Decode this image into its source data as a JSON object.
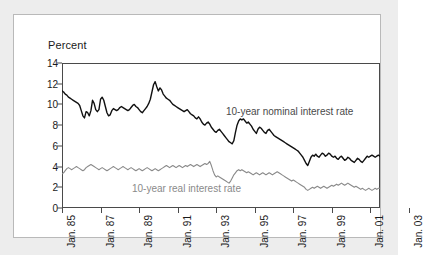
{
  "figure": {
    "y_axis_title": "Percent",
    "annotations": {
      "nominal": "10-year nominal interest rate",
      "real": "10-year real interest rate"
    }
  },
  "chart_data": {
    "type": "line",
    "title": "",
    "xlabel": "",
    "ylabel": "Percent",
    "ylim": [
      0,
      14
    ],
    "yticks": [
      "0",
      "2",
      "4",
      "6",
      "8",
      "10",
      "12",
      "14"
    ],
    "grid": false,
    "legend_position": "inline-annotation",
    "xlim": [
      "Jan. 85",
      "Jul. 03"
    ],
    "xticks": [
      "Jan. 85",
      "Jan. 87",
      "Jan. 89",
      "Jan. 91",
      "Jan. 93",
      "Jan. 95",
      "Jan. 97",
      "Jan. 99",
      "Jan. 01",
      "Jan. 03"
    ],
    "colors": {
      "nominal": "#111111",
      "real": "#8a8a8a"
    },
    "series": [
      {
        "name": "10-year nominal interest rate",
        "color": "#111111",
        "values": [
          11.3,
          11.2,
          11.0,
          10.9,
          10.7,
          10.6,
          10.5,
          10.4,
          10.3,
          10.2,
          10.1,
          9.9,
          9.4,
          8.9,
          8.7,
          9.3,
          9.2,
          8.9,
          9.4,
          10.4,
          10.1,
          9.5,
          9.3,
          9.5,
          10.5,
          10.7,
          10.4,
          9.8,
          9.2,
          8.9,
          9.0,
          9.4,
          9.6,
          9.5,
          9.4,
          9.5,
          9.7,
          9.8,
          9.7,
          9.6,
          9.5,
          9.4,
          9.5,
          9.7,
          9.9,
          10.0,
          9.8,
          9.7,
          9.5,
          9.3,
          9.2,
          9.4,
          9.6,
          9.8,
          10.1,
          10.5,
          11.2,
          11.9,
          12.2,
          11.7,
          11.3,
          11.6,
          11.4,
          11.0,
          10.8,
          10.6,
          10.5,
          10.4,
          10.2,
          10.0,
          9.9,
          9.8,
          9.7,
          9.6,
          9.5,
          9.4,
          9.3,
          9.4,
          9.5,
          9.3,
          9.1,
          9.0,
          8.9,
          8.7,
          8.6,
          8.8,
          8.6,
          8.3,
          8.1,
          8.0,
          8.2,
          8.3,
          8.1,
          7.8,
          7.6,
          7.4,
          7.3,
          7.5,
          7.6,
          7.4,
          7.2,
          7.0,
          6.8,
          6.6,
          6.4,
          6.3,
          6.2,
          6.5,
          7.3,
          8.0,
          8.4,
          8.6,
          8.5,
          8.6,
          8.4,
          8.2,
          8.3,
          8.1,
          7.9,
          7.6,
          7.4,
          7.2,
          7.6,
          7.8,
          7.7,
          7.5,
          7.3,
          7.2,
          7.5,
          7.6,
          7.4,
          7.2,
          7.0,
          6.9,
          6.8,
          6.7,
          6.6,
          6.5,
          6.4,
          6.3,
          6.2,
          6.1,
          6.0,
          5.9,
          5.8,
          5.7,
          5.6,
          5.5,
          5.3,
          5.1,
          4.9,
          4.6,
          4.3,
          4.1,
          4.5,
          4.9,
          5.1,
          5.0,
          5.2,
          5.0,
          4.9,
          5.1,
          5.3,
          5.2,
          5.0,
          5.1,
          5.3,
          5.2,
          5.0,
          4.9,
          5.0,
          4.8,
          4.7,
          4.9,
          5.0,
          4.8,
          4.6,
          4.7,
          4.9,
          4.8,
          4.6,
          4.5,
          4.4,
          4.6,
          4.8,
          4.7,
          4.5,
          4.4,
          4.6,
          4.8,
          5.0,
          4.9,
          5.0,
          5.1,
          5.0,
          4.9,
          5.0,
          5.1,
          5.0
        ]
      },
      {
        "name": "10-year real interest rate",
        "color": "#8a8a8a",
        "values": [
          3.3,
          3.4,
          3.6,
          3.8,
          3.9,
          3.8,
          3.7,
          3.8,
          3.9,
          4.0,
          3.9,
          3.8,
          3.7,
          3.6,
          3.7,
          3.9,
          4.0,
          4.1,
          4.2,
          4.1,
          4.0,
          3.9,
          3.8,
          3.7,
          3.8,
          3.9,
          3.8,
          3.7,
          3.6,
          3.7,
          3.8,
          3.9,
          4.0,
          3.9,
          3.8,
          3.7,
          3.8,
          3.9,
          4.0,
          3.9,
          3.8,
          3.7,
          3.8,
          3.9,
          3.8,
          3.7,
          3.6,
          3.7,
          3.8,
          3.7,
          3.6,
          3.7,
          3.8,
          3.9,
          3.8,
          3.7,
          3.6,
          3.7,
          3.8,
          3.7,
          3.6,
          3.7,
          3.8,
          3.9,
          4.0,
          4.1,
          4.0,
          3.9,
          4.0,
          4.1,
          4.0,
          3.9,
          4.0,
          4.1,
          4.0,
          3.9,
          4.0,
          4.1,
          4.0,
          4.1,
          4.2,
          4.1,
          4.0,
          4.1,
          4.2,
          4.1,
          4.0,
          4.1,
          4.2,
          4.3,
          4.2,
          4.3,
          4.5,
          4.1,
          3.6,
          3.2,
          3.0,
          3.1,
          3.0,
          2.9,
          2.8,
          2.7,
          2.6,
          2.5,
          2.4,
          2.6,
          2.9,
          3.2,
          3.4,
          3.6,
          3.7,
          3.6,
          3.7,
          3.6,
          3.5,
          3.4,
          3.5,
          3.4,
          3.3,
          3.2,
          3.3,
          3.4,
          3.3,
          3.2,
          3.3,
          3.4,
          3.3,
          3.2,
          3.3,
          3.4,
          3.3,
          3.2,
          3.3,
          3.4,
          3.5,
          3.4,
          3.3,
          3.2,
          3.1,
          3.0,
          2.9,
          2.8,
          2.7,
          2.6,
          2.7,
          2.6,
          2.5,
          2.4,
          2.3,
          2.2,
          2.1,
          2.0,
          1.8,
          1.7,
          1.8,
          1.9,
          2.0,
          1.9,
          2.0,
          2.1,
          2.0,
          1.9,
          2.0,
          2.1,
          2.0,
          1.9,
          2.0,
          2.1,
          2.2,
          2.1,
          2.2,
          2.3,
          2.2,
          2.3,
          2.4,
          2.3,
          2.2,
          2.3,
          2.4,
          2.3,
          2.2,
          2.1,
          2.0,
          2.1,
          2.0,
          1.9,
          1.8,
          1.9,
          1.8,
          1.7,
          1.8,
          1.9,
          1.8,
          1.7,
          1.8,
          1.9,
          1.8,
          1.9,
          1.9
        ]
      }
    ]
  }
}
